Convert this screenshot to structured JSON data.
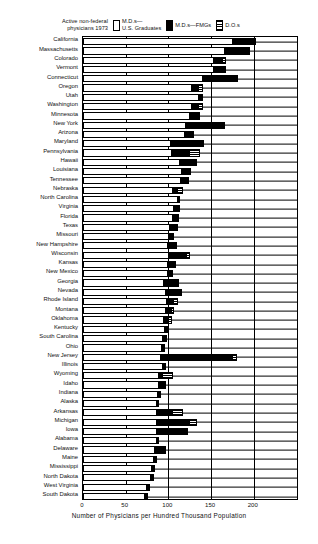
{
  "legend": {
    "title": "Active non-federal\nphysicians 1973",
    "items": [
      {
        "swatch": "us-graduates-swatch",
        "label": "M.D.s—\nU.S. Graduates"
      },
      {
        "swatch": "fmg-swatch",
        "label": "M.D.s—FMGs"
      },
      {
        "swatch": "do-swatch",
        "label": "D.O.s"
      }
    ]
  },
  "axis": {
    "xlabel": "Number of Physicians per Hundred Thousand Population",
    "ticks": [
      0,
      50,
      100,
      150,
      200
    ],
    "xmin": 0,
    "xmax": 253
  },
  "chart_data": {
    "type": "bar",
    "orientation": "horizontal",
    "stacked": true,
    "title": "Active non-federal physicians 1973",
    "xlabel": "Number of Physicians per Hundred Thousand Population",
    "ylabel": "",
    "xlim": [
      0,
      253
    ],
    "grid": true,
    "legend_position": "top",
    "series": [
      {
        "name": "M.D.s—U.S. Graduates",
        "color": "#ffffff"
      },
      {
        "name": "M.D.s—FMGs",
        "color": "#000000"
      },
      {
        "name": "D.O.s",
        "color": "#ffffff"
      }
    ],
    "categories": [
      "California",
      "Massachusetts",
      "Colorado",
      "Vermont",
      "Connecticut",
      "Oregon",
      "Utah",
      "Washington",
      "Minnesota",
      "New York",
      "Arizona",
      "Maryland",
      "Pennsylvania",
      "Hawaii",
      "Louisiana",
      "Tennessee",
      "Nebraska",
      "North Carolina",
      "Virginia",
      "Florida",
      "Texas",
      "Missouri",
      "New Hampshire",
      "Wisconsin",
      "Kansas",
      "New Mexico",
      "Georgia",
      "Nevada",
      "Rhode Island",
      "Montana",
      "Oklahoma",
      "Kentucky",
      "South Carolina",
      "Ohio",
      "New Jersey",
      "Illinois",
      "Wyoming",
      "Idaho",
      "Indiana",
      "Alaska",
      "Arkansas",
      "Michigan",
      "Iowa",
      "Alabama",
      "Delaware",
      "Maine",
      "Mississippi",
      "North Dakota",
      "West Virginia",
      "South Dakota"
    ],
    "rows": [
      {
        "state": "California",
        "us": 174,
        "fmg": 27,
        "do": 2
      },
      {
        "state": "Massachusetts",
        "us": 165,
        "fmg": 31,
        "do": 0
      },
      {
        "state": "Colorado",
        "us": 152,
        "fmg": 12,
        "do": 3
      },
      {
        "state": "Vermont",
        "us": 152,
        "fmg": 14,
        "do": 2
      },
      {
        "state": "Connecticut",
        "us": 139,
        "fmg": 42,
        "do": 0
      },
      {
        "state": "Oregon",
        "us": 126,
        "fmg": 10,
        "do": 5
      },
      {
        "state": "Utah",
        "us": 135,
        "fmg": 5,
        "do": 0
      },
      {
        "state": "Washington",
        "us": 126,
        "fmg": 10,
        "do": 4
      },
      {
        "state": "Minnesota",
        "us": 124,
        "fmg": 13,
        "do": 0
      },
      {
        "state": "New York",
        "us": 120,
        "fmg": 46,
        "do": 0
      },
      {
        "state": "Arizona",
        "us": 118,
        "fmg": 12,
        "do": 0
      },
      {
        "state": "Maryland",
        "us": 102,
        "fmg": 40,
        "do": 0
      },
      {
        "state": "Pennsylvania",
        "us": 103,
        "fmg": 22,
        "do": 12
      },
      {
        "state": "Hawaii",
        "us": 112,
        "fmg": 22,
        "do": 0
      },
      {
        "state": "Louisiana",
        "us": 115,
        "fmg": 12,
        "do": 0
      },
      {
        "state": "Tennessee",
        "us": 114,
        "fmg": 10,
        "do": 0
      },
      {
        "state": "Nebraska",
        "us": 104,
        "fmg": 7,
        "do": 6
      },
      {
        "state": "North Carolina",
        "us": 110,
        "fmg": 4,
        "do": 0
      },
      {
        "state": "Virginia",
        "us": 106,
        "fmg": 8,
        "do": 0
      },
      {
        "state": "Florida",
        "us": 104,
        "fmg": 9,
        "do": 0
      },
      {
        "state": "Texas",
        "us": 101,
        "fmg": 10,
        "do": 0
      },
      {
        "state": "Missouri",
        "us": 99,
        "fmg": 8,
        "do": 0
      },
      {
        "state": "New Hampshire",
        "us": 98,
        "fmg": 12,
        "do": 0
      },
      {
        "state": "Wisconsin",
        "us": 100,
        "fmg": 22,
        "do": 3
      },
      {
        "state": "Kansas",
        "us": 98,
        "fmg": 11,
        "do": 0
      },
      {
        "state": "New Mexico",
        "us": 98,
        "fmg": 7,
        "do": 0
      },
      {
        "state": "Georgia",
        "us": 94,
        "fmg": 18,
        "do": 0
      },
      {
        "state": "Nevada",
        "us": 96,
        "fmg": 20,
        "do": 0
      },
      {
        "state": "Rhode Island",
        "us": 97,
        "fmg": 10,
        "do": 4
      },
      {
        "state": "Montana",
        "us": 96,
        "fmg": 8,
        "do": 3
      },
      {
        "state": "Oklahoma",
        "us": 94,
        "fmg": 7,
        "do": 3
      },
      {
        "state": "Kentucky",
        "us": 95,
        "fmg": 6,
        "do": 0
      },
      {
        "state": "South Carolina",
        "us": 93,
        "fmg": 5,
        "do": 0
      },
      {
        "state": "Ohio",
        "us": 91,
        "fmg": 5,
        "do": 0
      },
      {
        "state": "New Jersey",
        "us": 90,
        "fmg": 86,
        "do": 4
      },
      {
        "state": "Illinois",
        "us": 92,
        "fmg": 5,
        "do": 0
      },
      {
        "state": "Wyoming",
        "us": 88,
        "fmg": 6,
        "do": 12
      },
      {
        "state": "Idaho",
        "us": 88,
        "fmg": 9,
        "do": 0
      },
      {
        "state": "Indiana",
        "us": 87,
        "fmg": 4,
        "do": 0
      },
      {
        "state": "Alaska",
        "us": 85,
        "fmg": 4,
        "do": 0
      },
      {
        "state": "Arkansas",
        "us": 85,
        "fmg": 20,
        "do": 12
      },
      {
        "state": "Michigan",
        "us": 85,
        "fmg": 40,
        "do": 9
      },
      {
        "state": "Iowa",
        "us": 85,
        "fmg": 38,
        "do": 0
      },
      {
        "state": "Alabama",
        "us": 85,
        "fmg": 4,
        "do": 0
      },
      {
        "state": "Delaware",
        "us": 83,
        "fmg": 14,
        "do": 0
      },
      {
        "state": "Maine",
        "us": 82,
        "fmg": 5,
        "do": 0
      },
      {
        "state": "Mississippi",
        "us": 80,
        "fmg": 4,
        "do": 0
      },
      {
        "state": "North Dakota",
        "us": 78,
        "fmg": 5,
        "do": 0
      },
      {
        "state": "West Virginia",
        "us": 74,
        "fmg": 4,
        "do": 0
      },
      {
        "state": "South Dakota",
        "us": 72,
        "fmg": 4,
        "do": 0
      }
    ]
  },
  "states": [
    {
      "name": "California",
      "us": 174,
      "fmg": 27,
      "do": 2
    },
    {
      "name": "Massachusetts",
      "us": 165,
      "fmg": 31,
      "do": 0
    },
    {
      "name": "Colorado",
      "us": 152,
      "fmg": 12,
      "do": 3
    },
    {
      "name": "Vermont",
      "us": 152,
      "fmg": 14,
      "do": 2
    },
    {
      "name": "Connecticut",
      "us": 139,
      "fmg": 42,
      "do": 0
    },
    {
      "name": "Oregon",
      "us": 126,
      "fmg": 10,
      "do": 5
    },
    {
      "name": "Utah",
      "us": 135,
      "fmg": 5,
      "do": 0
    },
    {
      "name": "Washington",
      "us": 126,
      "fmg": 10,
      "do": 4
    },
    {
      "name": "Minnesota",
      "us": 124,
      "fmg": 13,
      "do": 0
    },
    {
      "name": "New York",
      "us": 120,
      "fmg": 46,
      "do": 0
    },
    {
      "name": "Arizona",
      "us": 118,
      "fmg": 12,
      "do": 0
    },
    {
      "name": "Maryland",
      "us": 102,
      "fmg": 40,
      "do": 0
    },
    {
      "name": "Pennsylvania",
      "us": 103,
      "fmg": 22,
      "do": 12
    },
    {
      "name": "Hawaii",
      "us": 112,
      "fmg": 22,
      "do": 0
    },
    {
      "name": "Louisiana",
      "us": 115,
      "fmg": 12,
      "do": 0
    },
    {
      "name": "Tennessee",
      "us": 114,
      "fmg": 10,
      "do": 0
    },
    {
      "name": "Nebraska",
      "us": 104,
      "fmg": 7,
      "do": 6
    },
    {
      "name": "North Carolina",
      "us": 110,
      "fmg": 4,
      "do": 0
    },
    {
      "name": "Virginia",
      "us": 106,
      "fmg": 8,
      "do": 0
    },
    {
      "name": "Florida",
      "us": 104,
      "fmg": 9,
      "do": 0
    },
    {
      "name": "Texas",
      "us": 101,
      "fmg": 10,
      "do": 0
    },
    {
      "name": "Missouri",
      "us": 99,
      "fmg": 8,
      "do": 0
    },
    {
      "name": "New Hampshire",
      "us": 98,
      "fmg": 12,
      "do": 0
    },
    {
      "name": "Wisconsin",
      "us": 100,
      "fmg": 22,
      "do": 3
    },
    {
      "name": "Kansas",
      "us": 98,
      "fmg": 11,
      "do": 0
    },
    {
      "name": "New Mexico",
      "us": 98,
      "fmg": 7,
      "do": 0
    },
    {
      "name": "Georgia",
      "us": 94,
      "fmg": 18,
      "do": 0
    },
    {
      "name": "Nevada",
      "us": 96,
      "fmg": 20,
      "do": 0
    },
    {
      "name": "Rhode Island",
      "us": 97,
      "fmg": 10,
      "do": 4
    },
    {
      "name": "Montana",
      "us": 96,
      "fmg": 8,
      "do": 3
    },
    {
      "name": "Oklahoma",
      "us": 94,
      "fmg": 7,
      "do": 3
    },
    {
      "name": "Kentucky",
      "us": 95,
      "fmg": 6,
      "do": 0
    },
    {
      "name": "South Carolina",
      "us": 93,
      "fmg": 5,
      "do": 0
    },
    {
      "name": "Ohio",
      "us": 91,
      "fmg": 5,
      "do": 0
    },
    {
      "name": "New Jersey",
      "us": 90,
      "fmg": 86,
      "do": 4
    },
    {
      "name": "Illinois",
      "us": 92,
      "fmg": 5,
      "do": 0
    },
    {
      "name": "Wyoming",
      "us": 88,
      "fmg": 6,
      "do": 12
    },
    {
      "name": "Idaho",
      "us": 88,
      "fmg": 9,
      "do": 0
    },
    {
      "name": "Indiana",
      "us": 87,
      "fmg": 4,
      "do": 0
    },
    {
      "name": "Alaska",
      "us": 85,
      "fmg": 4,
      "do": 0
    },
    {
      "name": "Arkansas",
      "us": 85,
      "fmg": 20,
      "do": 12
    },
    {
      "name": "Michigan",
      "us": 85,
      "fmg": 40,
      "do": 9
    },
    {
      "name": "Iowa",
      "us": 85,
      "fmg": 38,
      "do": 0
    },
    {
      "name": "Alabama",
      "us": 85,
      "fmg": 4,
      "do": 0
    },
    {
      "name": "Delaware",
      "us": 83,
      "fmg": 14,
      "do": 0
    },
    {
      "name": "Maine",
      "us": 82,
      "fmg": 5,
      "do": 0
    },
    {
      "name": "Mississippi",
      "us": 80,
      "fmg": 4,
      "do": 0
    },
    {
      "name": "North Dakota",
      "us": 78,
      "fmg": 5,
      "do": 0
    },
    {
      "name": "West Virginia",
      "us": 74,
      "fmg": 4,
      "do": 0
    },
    {
      "name": "South Dakota",
      "us": 72,
      "fmg": 4,
      "do": 0
    }
  ]
}
